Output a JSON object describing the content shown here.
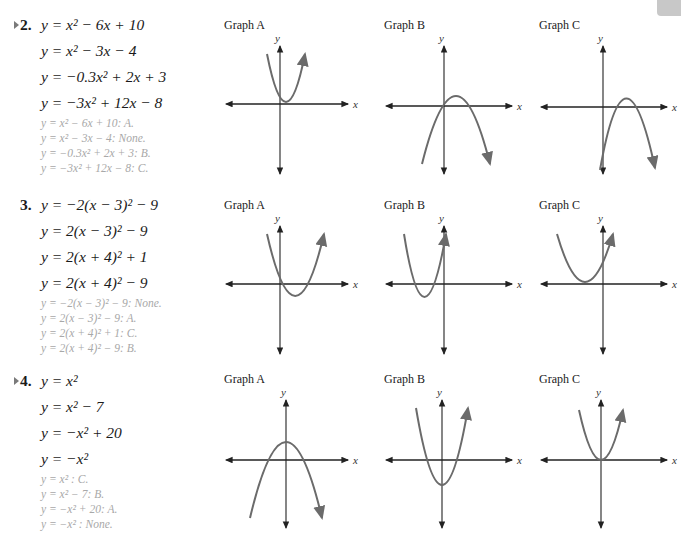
{
  "colors": {
    "curve": "#6b6b6b",
    "axis": "#222222",
    "answer_text": "#a8a8a8",
    "equation_text": "#1a1a1a"
  },
  "graph_titles": [
    "Graph A",
    "Graph B",
    "Graph C"
  ],
  "axis_labels": {
    "x": "x",
    "y": "y"
  },
  "problems": [
    {
      "number": "2.",
      "has_marker": true,
      "equations": [
        "y = x² − 6x + 10",
        "y = x² − 3x − 4",
        "y = −0.3x² + 2x + 3",
        "y = −3x² + 12x − 8"
      ],
      "answers": [
        "y = x² − 6x + 10: A.",
        "y = x² − 3x − 4: None.",
        "y = −0.3x² + 2x + 3: B.",
        "y = −3x² + 12x − 8: C."
      ],
      "graphs": [
        {
          "title": "Graph A",
          "shape": "upward parabola, vertex right of y-axis just above x-axis, narrow"
        },
        {
          "title": "Graph B",
          "shape": "downward parabola, vertex slightly right of y-axis above x-axis, wide"
        },
        {
          "title": "Graph C",
          "shape": "downward parabola, vertex right of y-axis above x-axis, y-intercept below"
        }
      ]
    },
    {
      "number": "3.",
      "has_marker": false,
      "equations": [
        "y = −2(x − 3)² − 9",
        "y = 2(x − 3)² − 9",
        "y = 2(x + 4)² + 1",
        "y = 2(x + 4)² − 9"
      ],
      "answers": [
        "y = −2(x − 3)² − 9: None.",
        "y = 2(x − 3)² − 9: A.",
        "y = 2(x + 4)² + 1: C.",
        "y = 2(x + 4)² − 9: B."
      ],
      "graphs": [
        {
          "title": "Graph A",
          "shape": "upward parabola, vertex right of y-axis below x-axis"
        },
        {
          "title": "Graph B",
          "shape": "upward parabola, vertex left of y-axis below x-axis"
        },
        {
          "title": "Graph C",
          "shape": "upward parabola, vertex left of y-axis just above x-axis"
        }
      ]
    },
    {
      "number": "4.",
      "has_marker": true,
      "equations": [
        "y = x²",
        "y = x² − 7",
        "y = −x² + 20",
        "y = −x²"
      ],
      "answers": [
        "y = x² : C.",
        "y = x² − 7: B.",
        "y = −x² + 20: A.",
        "y = −x² : None."
      ],
      "graphs": [
        {
          "title": "Graph A",
          "shape": "downward parabola, vertex on y-axis above x-axis"
        },
        {
          "title": "Graph B",
          "shape": "upward parabola, vertex on y-axis below x-axis"
        },
        {
          "title": "Graph C",
          "shape": "upward parabola, vertex at origin"
        }
      ]
    }
  ]
}
